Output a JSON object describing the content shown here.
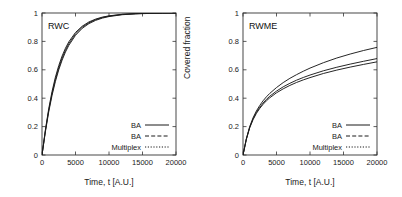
{
  "figure": {
    "background": "#ffffff",
    "line_color": "#1a1a1a",
    "axis_color": "#333333"
  },
  "chart_data": [
    {
      "type": "line",
      "title": "RWC",
      "xlabel": "Time, t [A.U.]",
      "ylabel": "Covered fraction",
      "xlim": [
        0,
        20000
      ],
      "ylim": [
        0,
        1
      ],
      "xticks": [
        0,
        5000,
        10000,
        15000,
        20000
      ],
      "xticklabels": [
        "0",
        "5000",
        "10000",
        "15000",
        "20000"
      ],
      "yticks": [
        0,
        0.2,
        0.4,
        0.6,
        0.8,
        1
      ],
      "yticklabels": [
        "0",
        "0.2",
        "0.4",
        "0.6",
        "0.8",
        "1"
      ],
      "grid": false,
      "legend_position": "lower right",
      "x": [
        0,
        500,
        1000,
        1500,
        2000,
        2500,
        3000,
        3500,
        4000,
        5000,
        6000,
        7000,
        8000,
        9000,
        10000,
        12000,
        14000,
        16000,
        18000,
        20000
      ],
      "series": [
        {
          "name": "BA",
          "linestyle": "solid",
          "values": [
            0,
            0.175,
            0.325,
            0.448,
            0.548,
            0.63,
            0.697,
            0.752,
            0.797,
            0.863,
            0.907,
            0.937,
            0.957,
            0.971,
            0.98,
            0.991,
            0.996,
            0.998,
            0.999,
            1.0
          ]
        },
        {
          "name": "BA",
          "linestyle": "dashed",
          "values": [
            0,
            0.168,
            0.313,
            0.433,
            0.532,
            0.614,
            0.682,
            0.738,
            0.784,
            0.853,
            0.9,
            0.931,
            0.953,
            0.968,
            0.978,
            0.99,
            0.995,
            0.998,
            0.999,
            1.0
          ]
        },
        {
          "name": "Multiplex",
          "linestyle": "dotted",
          "values": [
            0,
            0.162,
            0.303,
            0.42,
            0.518,
            0.6,
            0.668,
            0.725,
            0.772,
            0.843,
            0.892,
            0.925,
            0.948,
            0.964,
            0.975,
            0.988,
            0.994,
            0.997,
            0.999,
            1.0
          ]
        }
      ]
    },
    {
      "type": "line",
      "title": "RWME",
      "xlabel": "Time, t [A.U.]",
      "ylabel": "Covered fraction",
      "xlim": [
        0,
        20000
      ],
      "ylim": [
        0,
        1
      ],
      "xticks": [
        0,
        5000,
        10000,
        15000,
        20000
      ],
      "xticklabels": [
        "0",
        "5000",
        "10000",
        "15000",
        "20000"
      ],
      "yticks": [
        0,
        0.2,
        0.4,
        0.6,
        0.8,
        1
      ],
      "yticklabels": [
        "0",
        "0.2",
        "0.4",
        "0.6",
        "0.8",
        "1"
      ],
      "grid": false,
      "legend_position": "lower right",
      "x": [
        0,
        500,
        1000,
        1500,
        2000,
        2500,
        3000,
        3500,
        4000,
        5000,
        6000,
        7000,
        8000,
        9000,
        10000,
        12000,
        14000,
        16000,
        18000,
        20000
      ],
      "series": [
        {
          "name": "BA",
          "linestyle": "solid",
          "values": [
            0,
            0.115,
            0.2,
            0.262,
            0.31,
            0.349,
            0.382,
            0.41,
            0.434,
            0.475,
            0.51,
            0.54,
            0.566,
            0.59,
            0.612,
            0.65,
            0.683,
            0.711,
            0.736,
            0.758
          ]
        },
        {
          "name": "BA",
          "linestyle": "dashed",
          "values": [
            0,
            0.112,
            0.195,
            0.254,
            0.3,
            0.336,
            0.366,
            0.392,
            0.414,
            0.45,
            0.48,
            0.505,
            0.527,
            0.546,
            0.563,
            0.593,
            0.618,
            0.64,
            0.66,
            0.679
          ]
        },
        {
          "name": "Multiplex",
          "linestyle": "dotted",
          "values": [
            0,
            0.11,
            0.191,
            0.249,
            0.293,
            0.328,
            0.357,
            0.382,
            0.403,
            0.438,
            0.466,
            0.49,
            0.511,
            0.529,
            0.545,
            0.574,
            0.598,
            0.619,
            0.638,
            0.656
          ]
        }
      ]
    }
  ],
  "legend": {
    "entries": [
      {
        "label": "BA",
        "style": "solid"
      },
      {
        "label": "BA",
        "style": "dashed"
      },
      {
        "label": "Multiplex",
        "style": "dotted"
      }
    ]
  }
}
